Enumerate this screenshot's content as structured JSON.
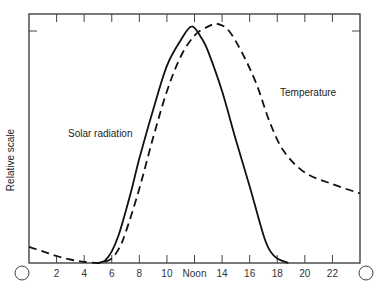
{
  "chart_data": {
    "type": "line",
    "title": "",
    "xlabel": "Hour of day",
    "ylabel": "Relative scale",
    "x_tick_labels": [
      "○",
      "2",
      "4",
      "6",
      "8",
      "10",
      "Noon",
      "14",
      "16",
      "18",
      "20",
      "22",
      "○"
    ],
    "x_ticks": [
      0,
      2,
      4,
      6,
      8,
      10,
      12,
      14,
      16,
      18,
      20,
      22,
      24
    ],
    "xlim": [
      0,
      24
    ],
    "ylim": [
      0,
      1.1
    ],
    "grid": false,
    "legend": "inline labels",
    "series": [
      {
        "name": "Solar radiation",
        "style": "solid",
        "x": [
          0,
          4,
          5,
          5.5,
          6,
          6.5,
          7,
          7.5,
          8,
          9,
          10,
          11,
          11.8,
          12.5,
          13,
          14,
          15,
          16,
          17,
          17.5,
          18,
          18.8,
          24
        ],
        "y": [
          0,
          0,
          0,
          0.01,
          0.05,
          0.12,
          0.22,
          0.33,
          0.45,
          0.66,
          0.85,
          0.96,
          1.02,
          0.97,
          0.91,
          0.74,
          0.53,
          0.33,
          0.12,
          0.05,
          0.02,
          0,
          0
        ]
      },
      {
        "name": "Temperature",
        "style": "dashed",
        "x": [
          0,
          1,
          2,
          3,
          4,
          5,
          5.5,
          6,
          6.5,
          7,
          8,
          9,
          10,
          11,
          12,
          13,
          13.7,
          14.5,
          15.5,
          16.5,
          17.5,
          18.5,
          20,
          22,
          24
        ],
        "y": [
          0.07,
          0.05,
          0.03,
          0.015,
          0.005,
          0,
          0.005,
          0.02,
          0.06,
          0.13,
          0.32,
          0.54,
          0.74,
          0.89,
          0.98,
          1.02,
          1.03,
          1.0,
          0.9,
          0.77,
          0.6,
          0.48,
          0.39,
          0.34,
          0.3
        ]
      }
    ],
    "annotations": [
      {
        "text": "Solar radiation",
        "x": 7.2,
        "y": 0.56
      },
      {
        "text": "Temperature",
        "x": 18.0,
        "y": 0.73
      }
    ]
  },
  "labels": {
    "ylabel": "Relative scale",
    "solar": "Solar radiation",
    "temperature": "Temperature",
    "ticks": [
      "2",
      "4",
      "6",
      "8",
      "10",
      "Noon",
      "14",
      "16",
      "18",
      "20",
      "22"
    ]
  }
}
